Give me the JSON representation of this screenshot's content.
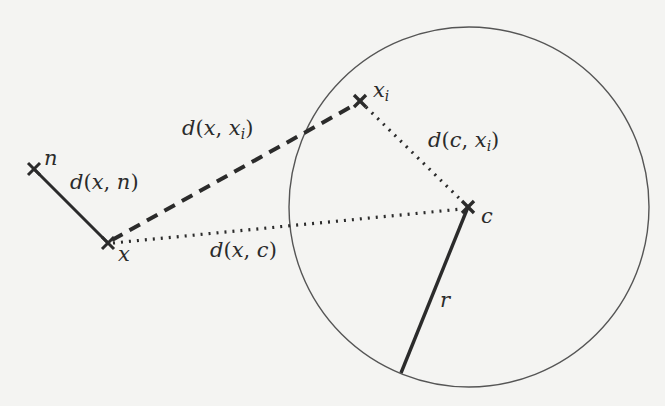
{
  "diagram": {
    "title": "",
    "colors": {
      "background": "#f4f4f2",
      "ink": "#2b2b2b",
      "circle": "#555555"
    },
    "points": [
      {
        "id": "n",
        "label": "n",
        "x": 34,
        "y": 169
      },
      {
        "id": "x",
        "label": "x",
        "x": 108,
        "y": 243
      },
      {
        "id": "xi",
        "label": "x",
        "sub": "i",
        "x": 360,
        "y": 101
      },
      {
        "id": "c",
        "label": "c",
        "x": 468,
        "y": 207
      }
    ],
    "circle": {
      "center": "c",
      "cx": 469,
      "cy": 207,
      "r": 180
    },
    "edges": [
      {
        "from": "x",
        "to": "n",
        "style": "solid",
        "label": "d(x, n)"
      },
      {
        "from": "x",
        "to": "xi",
        "style": "dashed",
        "label": "d(x, x_i)"
      },
      {
        "from": "x",
        "to": "c",
        "style": "dotted",
        "label": "d(x, c)"
      },
      {
        "from": "xi",
        "to": "c",
        "style": "dotted",
        "label": "d(c, x_i)"
      },
      {
        "from": "c",
        "to": "circle-edge",
        "style": "solid",
        "label": "r"
      }
    ],
    "labels": {
      "n": "n",
      "x": "x",
      "xi_main": "x",
      "xi_sub": "i",
      "c": "c",
      "r": "r",
      "d_x_n": {
        "d": "d",
        "open": "(",
        "a": "x",
        "comma": ", ",
        "b": "n",
        "close": ")"
      },
      "d_x_xi": {
        "d": "d",
        "open": "(",
        "a": "x",
        "comma": ", ",
        "b": "x",
        "b_sub": "i",
        "close": ")"
      },
      "d_x_c": {
        "d": "d",
        "open": "(",
        "a": "x",
        "comma": ", ",
        "b": "c",
        "close": ")"
      },
      "d_c_xi": {
        "d": "d",
        "open": "(",
        "a": "c",
        "comma": ", ",
        "b": "x",
        "b_sub": "i",
        "close": ")"
      }
    }
  }
}
